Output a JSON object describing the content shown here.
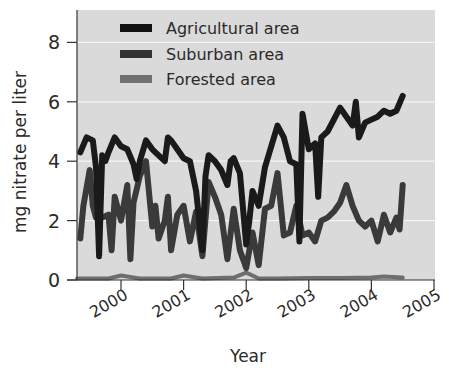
{
  "chart_data": {
    "type": "line",
    "title": "",
    "xlabel": "Year",
    "ylabel": "mg nitrate per liter",
    "xlim": [
      1999.3,
      2005
    ],
    "ylim": [
      0,
      9
    ],
    "x_ticks": [
      "2000",
      "2001",
      "2002",
      "2003",
      "2004",
      "2005"
    ],
    "y_ticks": [
      "0",
      "2",
      "4",
      "6",
      "8"
    ],
    "grid": "horizontal white lines at y ticks",
    "legend_position": "upper-left inside plot",
    "series": [
      {
        "name": "Agricultural area",
        "color": "#1a1a1a",
        "x": [
          1999.35,
          1999.45,
          1999.55,
          1999.6,
          1999.65,
          1999.7,
          1999.75,
          1999.8,
          1999.9,
          2000.0,
          2000.1,
          2000.2,
          2000.25,
          2000.3,
          2000.4,
          2000.5,
          2000.6,
          2000.7,
          2000.75,
          2000.8,
          2000.9,
          2001.0,
          2001.1,
          2001.2,
          2001.3,
          2001.35,
          2001.4,
          2001.5,
          2001.6,
          2001.7,
          2001.75,
          2001.8,
          2001.9,
          2002.0,
          2002.05,
          2002.1,
          2002.2,
          2002.3,
          2002.5,
          2002.6,
          2002.7,
          2002.8,
          2002.85,
          2002.9,
          2003.0,
          2003.1,
          2003.15,
          2003.2,
          2003.3,
          2003.5,
          2003.6,
          2003.7,
          2003.75,
          2003.8,
          2003.9,
          2004.0,
          2004.1,
          2004.2,
          2004.3,
          2004.4,
          2004.5
        ],
        "values": [
          4.3,
          4.8,
          4.7,
          3.8,
          0.8,
          4.2,
          4.0,
          4.3,
          4.8,
          4.5,
          4.4,
          3.9,
          3.4,
          4.0,
          4.7,
          4.4,
          4.2,
          4.0,
          4.8,
          4.7,
          4.4,
          4.1,
          4.0,
          3.0,
          1.0,
          3.5,
          4.2,
          4.0,
          3.7,
          3.2,
          4.0,
          4.1,
          3.6,
          1.2,
          2.0,
          3.0,
          2.5,
          3.8,
          5.2,
          4.8,
          4.0,
          3.9,
          1.3,
          5.6,
          4.4,
          4.6,
          2.8,
          4.8,
          5.0,
          5.8,
          5.5,
          5.2,
          6.0,
          4.8,
          5.3,
          5.4,
          5.5,
          5.7,
          5.6,
          5.7,
          6.2
        ]
      },
      {
        "name": "Suburban area",
        "color": "#3a3a3a",
        "x": [
          1999.35,
          1999.4,
          1999.5,
          1999.55,
          1999.6,
          1999.7,
          1999.8,
          1999.85,
          1999.9,
          2000.0,
          2000.1,
          2000.15,
          2000.2,
          2000.3,
          2000.4,
          2000.5,
          2000.55,
          2000.6,
          2000.7,
          2000.75,
          2000.8,
          2000.9,
          2001.0,
          2001.1,
          2001.2,
          2001.3,
          2001.4,
          2001.5,
          2001.6,
          2001.7,
          2001.8,
          2001.9,
          2002.0,
          2002.1,
          2002.2,
          2002.3,
          2002.4,
          2002.5,
          2002.6,
          2002.7,
          2002.8,
          2002.9,
          2003.0,
          2003.1,
          2003.2,
          2003.3,
          2003.4,
          2003.5,
          2003.6,
          2003.7,
          2003.8,
          2003.9,
          2004.0,
          2004.1,
          2004.2,
          2004.3,
          2004.4,
          2004.45,
          2004.5
        ],
        "values": [
          1.4,
          2.5,
          3.7,
          2.5,
          2.1,
          2.1,
          2.2,
          1.0,
          2.8,
          2.0,
          3.2,
          0.7,
          2.6,
          3.5,
          4.0,
          1.8,
          2.5,
          1.4,
          2.0,
          2.8,
          1.0,
          2.2,
          2.5,
          1.3,
          2.3,
          0.8,
          3.3,
          2.8,
          2.2,
          0.7,
          2.4,
          1.0,
          0.4,
          1.6,
          0.5,
          2.4,
          2.5,
          3.6,
          1.5,
          1.6,
          2.5,
          1.5,
          1.6,
          1.3,
          2.0,
          2.1,
          2.3,
          2.6,
          3.2,
          2.5,
          2.0,
          1.8,
          2.0,
          1.3,
          2.2,
          1.6,
          2.1,
          1.7,
          3.2
        ]
      },
      {
        "name": "Forested area",
        "color": "#6e6e6e",
        "x": [
          1999.3,
          1999.8,
          2000.0,
          2000.3,
          2000.8,
          2001.0,
          2001.3,
          2001.8,
          2002.0,
          2002.2,
          2002.5,
          2003.0,
          2003.5,
          2004.0,
          2004.2,
          2004.5
        ],
        "values": [
          0.05,
          0.05,
          0.15,
          0.05,
          0.05,
          0.15,
          0.05,
          0.08,
          0.25,
          0.05,
          0.05,
          0.07,
          0.07,
          0.08,
          0.12,
          0.08
        ]
      }
    ]
  },
  "labels": {
    "ylabel": "mg nitrate per liter",
    "xlabel": "Year",
    "legend": [
      "Agricultural area",
      "Suburban area",
      "Forested area"
    ],
    "x_ticks": [
      "2000",
      "2001",
      "2002",
      "2003",
      "2004",
      "2005"
    ],
    "y_ticks": [
      "0",
      "2",
      "4",
      "6",
      "8"
    ]
  }
}
